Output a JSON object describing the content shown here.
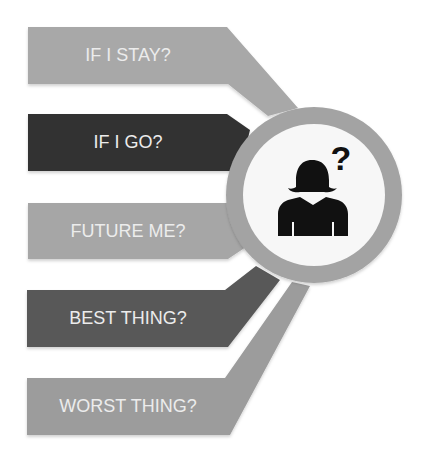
{
  "diagram": {
    "type": "radial-question-banners",
    "center_icon": "woman-with-question-mark-icon",
    "colors": {
      "background": "#ffffff",
      "ring": "#a3a3a3",
      "ring_inner": "#f7f7f7",
      "icon": "#111111",
      "label_text": "#ececec"
    },
    "banners": [
      {
        "label": "IF I STAY?",
        "color": "#a8a8a8"
      },
      {
        "label": "IF I GO?",
        "color": "#333333"
      },
      {
        "label": "FUTURE ME?",
        "color": "#a6a6a6"
      },
      {
        "label": "BEST THING?",
        "color": "#595959"
      },
      {
        "label": "WORST THING?",
        "color": "#9c9c9c"
      }
    ]
  }
}
